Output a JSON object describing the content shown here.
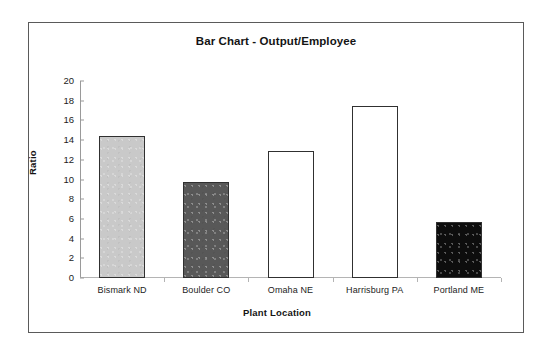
{
  "chart_data": {
    "type": "bar",
    "title": "Bar Chart - Output/Employee",
    "xlabel": "Plant Location",
    "ylabel": "Ratio",
    "categories": [
      "Bismark ND",
      "Boulder CO",
      "Omaha NE",
      "Harrisburg PA",
      "Portland ME"
    ],
    "values": [
      14.4,
      9.7,
      12.9,
      17.5,
      5.7
    ],
    "ylim": [
      0,
      20
    ],
    "ytick_labels": [
      "20",
      "18",
      "16",
      "14",
      "12",
      "10",
      "8",
      "6",
      "4",
      "2",
      "0"
    ],
    "ytick_values": [
      20,
      18,
      16,
      14,
      12,
      10,
      8,
      6,
      4,
      2,
      0
    ],
    "grid": false,
    "legend": "none",
    "bar_colors": [
      "#c9c9c9",
      "#585858",
      "#ffffff",
      "#ffffff",
      "#0d0d0d"
    ],
    "bar_border_color": "#303030",
    "axis_color": "#9a9a9a",
    "text_color": "#141414",
    "frame_border_color": "#5a5a5a",
    "background": "#ffffff"
  }
}
